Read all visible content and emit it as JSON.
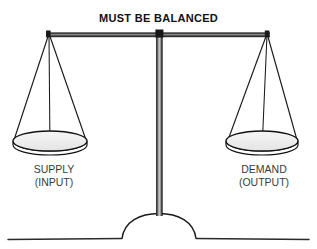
{
  "diagram": {
    "title": "MUST BE BALANCED",
    "type": "balance-scale",
    "left_pan": {
      "label_line1": "SUPPLY",
      "label_line2": "(INPUT)"
    },
    "right_pan": {
      "label_line1": "DEMAND",
      "label_line2": "(OUTPUT)"
    },
    "colors": {
      "ink": "#1a1a1a",
      "beam_dark": "#2b2b2b",
      "beam_light": "#9a9a9a",
      "pan_fill": "#f0f0f0",
      "pan_rim": "#111111",
      "post_dark": "#2a2a2a",
      "post_light": "#b8b8b8",
      "ground": "#2a2a2a",
      "label_text": "#3a3a3a",
      "title_text": "#111111",
      "background": "#ffffff"
    },
    "geometry": {
      "beam_left_x": 46,
      "beam_right_x": 270,
      "beam_y": 34,
      "pivot_x": 160,
      "post_bottom_y": 222,
      "ground_y": 238,
      "left_pan_center_x": 50,
      "right_pan_center_x": 262,
      "pan_center_y": 141
    },
    "state": "balanced"
  }
}
